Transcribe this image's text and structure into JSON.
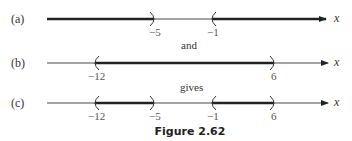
{
  "diagram": {
    "rows": [
      {
        "label": "(a)",
        "ticks": [
          "−5",
          "−1"
        ],
        "description": "x < -5 or x > -1"
      },
      {
        "label": "(b)",
        "ticks": [
          "−12",
          "6"
        ],
        "description": "-12 < x < 6"
      },
      {
        "label": "(c)",
        "ticks": [
          "−12",
          "−5",
          "−1",
          "6"
        ],
        "description": "-12 < x < -5 or -1 < x < 6"
      }
    ],
    "connector_1": "and",
    "connector_2": "gives",
    "axis_variable": "x",
    "caption": "Figure 2.62"
  }
}
